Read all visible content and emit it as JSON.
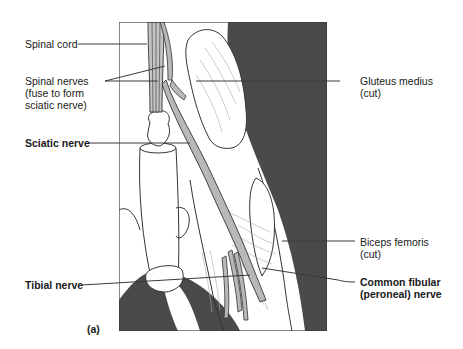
{
  "figure": {
    "panel_label": "(a)",
    "colors": {
      "frame": "#3a3a3a",
      "dark_background": "#4a4a4a",
      "nerve_fill": "#b8b8b8",
      "outline": "#333333",
      "leader_line": "#3a3a3a",
      "text": "#1a1a1a"
    }
  },
  "labels": {
    "spinal_cord": "Spinal cord",
    "spinal_nerves": "Spinal nerves\n(fuse to form\nsciatic nerve)",
    "sciatic_nerve": "Sciatic nerve",
    "tibial_nerve": "Tibial nerve",
    "gluteus_medius": "Gluteus medius\n(cut)",
    "biceps_femoris": "Biceps femoris\n(cut)",
    "common_fibular": "Common fibular\n(peroneal) nerve"
  }
}
